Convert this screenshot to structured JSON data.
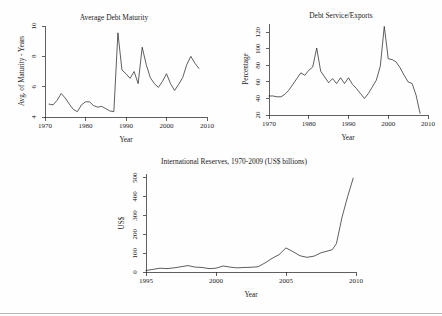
{
  "page": {
    "background": "#fefefe",
    "ink": "#1c1c1c"
  },
  "charts": {
    "maturity": {
      "title": "Average Debt Maturity",
      "xlabel": "Year",
      "ylabel": "Avg. of Maturity - Years",
      "xticks": [
        "1970",
        "1980",
        "1990",
        "2000",
        "2010"
      ],
      "yticks": [
        "4",
        "6",
        "8",
        "10"
      ]
    },
    "debt_service": {
      "title": "Debt Service/Exports",
      "xlabel": "Year",
      "ylabel": "Percentage",
      "xticks": [
        "1970",
        "1980",
        "1990",
        "2000",
        "2010"
      ],
      "yticks": [
        "20",
        "40",
        "60",
        "80",
        "100",
        "120"
      ]
    },
    "reserves": {
      "title": "International Reserves, 1970-2009 (US$ billions)",
      "xlabel": "Year",
      "ylabel": "US$",
      "xticks": [
        "1995",
        "2000",
        "2005",
        "2010"
      ],
      "yticks": [
        "0",
        "100",
        "200",
        "300",
        "400",
        "500"
      ]
    }
  },
  "chart_data": [
    {
      "id": "maturity",
      "type": "line",
      "title": "Average Debt Maturity",
      "xlabel": "Year",
      "ylabel": "Avg. of Maturity - Years",
      "xlim": [
        1970,
        2010
      ],
      "ylim": [
        4,
        10
      ],
      "grid": false,
      "legend": null,
      "x": [
        1971,
        1972,
        1973,
        1974,
        1975,
        1976,
        1977,
        1978,
        1979,
        1980,
        1981,
        1982,
        1983,
        1984,
        1985,
        1986,
        1987,
        1988,
        1989,
        1990,
        1991,
        1992,
        1993,
        1994,
        1995,
        1996,
        1997,
        1998,
        1999,
        2000,
        2001,
        2002,
        2003,
        2004,
        2005,
        2006,
        2007,
        2008
      ],
      "values": [
        4.85,
        4.8,
        5.1,
        5.55,
        5.25,
        4.85,
        4.5,
        4.35,
        4.8,
        5.0,
        5.0,
        4.75,
        4.65,
        4.7,
        4.55,
        4.4,
        4.35,
        9.55,
        7.1,
        6.85,
        6.55,
        7.0,
        6.2,
        8.6,
        7.45,
        6.6,
        6.2,
        5.95,
        6.35,
        6.85,
        6.2,
        5.75,
        6.15,
        6.6,
        7.45,
        8.0,
        7.55,
        7.2
      ]
    },
    {
      "id": "debt_service",
      "type": "line",
      "title": "Debt Service/Exports",
      "xlabel": "Year",
      "ylabel": "Percentage",
      "xlim": [
        1970,
        2010
      ],
      "ylim": [
        20,
        130
      ],
      "grid": false,
      "legend": null,
      "x": [
        1970,
        1971,
        1972,
        1973,
        1974,
        1975,
        1976,
        1977,
        1978,
        1979,
        1980,
        1981,
        1982,
        1983,
        1984,
        1985,
        1986,
        1987,
        1988,
        1989,
        1990,
        1991,
        1992,
        1993,
        1994,
        1995,
        1996,
        1997,
        1998,
        1999,
        2000,
        2001,
        2002,
        2003,
        2004,
        2005,
        2006,
        2007,
        2008
      ],
      "values": [
        43,
        43,
        42,
        42,
        45,
        50,
        57,
        64,
        71,
        68,
        74,
        78,
        101,
        73,
        66,
        59,
        64,
        58,
        65,
        58,
        65,
        57,
        52,
        46,
        40,
        46,
        54,
        62,
        79,
        127,
        88,
        87,
        84,
        77,
        68,
        60,
        58,
        44,
        22
      ]
    },
    {
      "id": "reserves",
      "type": "line",
      "title": "International Reserves, 1970-2009 (US$ billions)",
      "xlabel": "Year",
      "ylabel": "US$",
      "xlim": [
        1995,
        2010
      ],
      "ylim": [
        0,
        520
      ],
      "grid": false,
      "legend": null,
      "x": [
        1995,
        1995.5,
        1996,
        1996.5,
        1997,
        1997.5,
        1998,
        1998.5,
        1999,
        1999.5,
        2000,
        2000.5,
        2001,
        2001.5,
        2002,
        2002.5,
        2003,
        2003.5,
        2004,
        2004.5,
        2005,
        2005.5,
        2006,
        2006.5,
        2007,
        2007.5,
        2008,
        2008.3,
        2008.6,
        2009,
        2009.4,
        2009.8
      ],
      "values": [
        8,
        14,
        20,
        18,
        22,
        28,
        34,
        26,
        24,
        18,
        20,
        32,
        26,
        22,
        24,
        25,
        28,
        48,
        72,
        92,
        128,
        108,
        86,
        78,
        84,
        102,
        112,
        118,
        150,
        290,
        400,
        498
      ]
    }
  ]
}
